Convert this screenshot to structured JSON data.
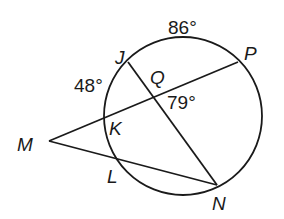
{
  "diagram": {
    "type": "circle-geometry",
    "circle": {
      "cx": 183,
      "cy": 116,
      "r": 79
    },
    "points": {
      "J": {
        "label": "J",
        "x": 128,
        "y": 60,
        "lx": 115,
        "ly": 64
      },
      "P": {
        "label": "P",
        "x": 238,
        "y": 62,
        "lx": 244,
        "ly": 60
      },
      "Q": {
        "label": "Q",
        "x": 156,
        "y": 97,
        "lx": 150,
        "ly": 84
      },
      "K": {
        "label": "K",
        "x": 104,
        "y": 118,
        "lx": 109,
        "ly": 135
      },
      "M": {
        "label": "M",
        "x": 49,
        "y": 141,
        "lx": 17,
        "ly": 151
      },
      "L": {
        "label": "L",
        "x": 114,
        "y": 160,
        "lx": 107,
        "ly": 183
      },
      "N": {
        "label": "N",
        "x": 217,
        "y": 185,
        "lx": 212,
        "ly": 210
      }
    },
    "segments": [
      {
        "from": "J",
        "to": "N"
      },
      {
        "from": "M",
        "to": "P"
      },
      {
        "from": "M",
        "to": "N"
      }
    ],
    "angle_labels": {
      "arc_JP": {
        "text": "86°",
        "x": 168,
        "y": 34
      },
      "arc_JK": {
        "text": "48°",
        "x": 74,
        "y": 92
      },
      "angle_Q": {
        "text": "79°",
        "x": 167,
        "y": 109
      }
    }
  }
}
